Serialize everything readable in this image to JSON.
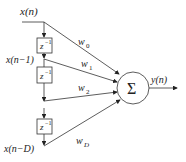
{
  "diagram": {
    "input_label": "x(n)",
    "delayed_label_1": "x(n−1)",
    "delayed_label_D": "x(n−D)",
    "delay_label": "z",
    "delay_exp": "−1",
    "weights": [
      "w",
      "w",
      "w",
      "w"
    ],
    "weight_subs": [
      "0",
      "1",
      "2",
      "D"
    ],
    "sum_symbol": "Σ",
    "output_label": "y(n)",
    "colors": {
      "stroke": "#333333",
      "box_fill": "#ffffff"
    }
  }
}
